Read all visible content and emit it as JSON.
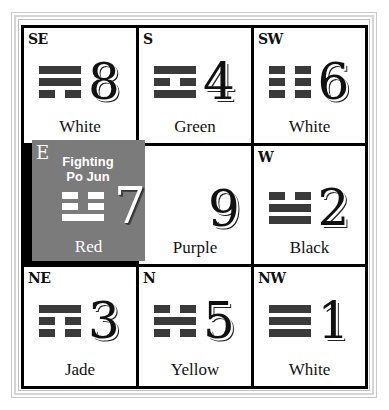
{
  "chart_title": "",
  "grid": {
    "cells": [
      {
        "direction": "SE",
        "number": "8",
        "color": "White",
        "trigram": [
          "solid",
          "solid",
          "broken"
        ]
      },
      {
        "direction": "S",
        "number": "4",
        "color": "Green",
        "trigram": [
          "solid",
          "broken",
          "solid"
        ]
      },
      {
        "direction": "SW",
        "number": "6",
        "color": "White",
        "trigram": [
          "broken",
          "broken",
          "broken"
        ]
      },
      {
        "direction": "E",
        "number": "7",
        "color": "Red",
        "trigram": [
          "broken",
          "broken",
          "solid"
        ],
        "star": "Fighting Po Jun",
        "star_line1": "Fighting",
        "star_line2": "Po Jun",
        "highlighted": true
      },
      {
        "direction": "",
        "number": "9",
        "color": "Purple",
        "trigram": []
      },
      {
        "direction": "W",
        "number": "2",
        "color": "Black",
        "trigram": [
          "broken",
          "solid",
          "solid"
        ]
      },
      {
        "direction": "NE",
        "number": "3",
        "color": "Jade",
        "trigram": [
          "solid",
          "broken",
          "broken"
        ]
      },
      {
        "direction": "N",
        "number": "5",
        "color": "Yellow",
        "trigram": [
          "broken",
          "solid",
          "broken"
        ]
      },
      {
        "direction": "NW",
        "number": "1",
        "color": "White",
        "trigram": [
          "solid",
          "solid",
          "solid"
        ]
      }
    ]
  },
  "colors": {
    "highlight_bg": "#7b7b7b",
    "trigram_bar": "#3a3a3a",
    "grid_line": "#000000"
  }
}
